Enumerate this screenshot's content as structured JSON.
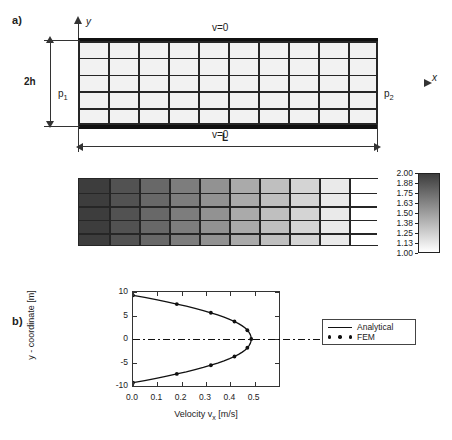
{
  "figure": {
    "panels": [
      {
        "id": "a",
        "label": "a)"
      },
      {
        "id": "b",
        "label": "b)"
      },
      {
        "id": "c",
        "label": "c)"
      }
    ]
  },
  "panel_a": {
    "label": "a)",
    "axis_y_label": "y",
    "axis_x_label": "x",
    "bc_top": "v=0",
    "bc_bottom": "v=0",
    "height_label": "2h",
    "length_label": "L",
    "pressure_inlet": "p",
    "pressure_inlet_sub": "1",
    "pressure_outlet": "p",
    "pressure_outlet_sub": "2",
    "mesh": {
      "columns": 10,
      "rows": 5
    }
  },
  "panel_b": {
    "label": "b)",
    "mesh": {
      "columns": 10,
      "rows": 5
    },
    "colorbar": {
      "max": "2.00",
      "min": "1.00",
      "labels": [
        "2.00",
        "1.88",
        "1.75",
        "1.63",
        "1.50",
        "1.38",
        "1.25",
        "1.13",
        "1.00"
      ],
      "dark_color": "#3d3d3d",
      "light_color": "#ffffff"
    },
    "cell_values": [
      2.0,
      1.89,
      1.78,
      1.67,
      1.56,
      1.44,
      1.33,
      1.22,
      1.11,
      1.0
    ]
  },
  "panel_c": {
    "label": "c)",
    "legend": [
      {
        "name": "analytical",
        "label": "Analytical",
        "style": "line"
      },
      {
        "name": "fem",
        "label": "FEM",
        "style": "dots"
      }
    ]
  },
  "chart_data": {
    "type": "line",
    "title": "",
    "xlabel": "Velocity v",
    "xlabel_sub": "x",
    "xlabel_unit": "[m/s]",
    "ylabel": "y - coordinate [m]",
    "xlim": [
      0.0,
      0.6
    ],
    "ylim": [
      -10,
      10
    ],
    "xticks": [
      0.0,
      0.1,
      0.2,
      0.3,
      0.4,
      0.5
    ],
    "xtick_labels": [
      "0.0",
      "0.1",
      "0.2",
      "0.3",
      "0.4",
      "0.5"
    ],
    "yticks": [
      -10,
      -5,
      0,
      5,
      10
    ],
    "ytick_labels": [
      "-10",
      "-5",
      "0",
      "5",
      "10"
    ],
    "grid": false,
    "legend_position": "right-outside",
    "centerline_y": 0,
    "series": [
      {
        "name": "Analytical",
        "type": "line",
        "x": [
          0.0,
          0.048,
          0.095,
          0.139,
          0.18,
          0.219,
          0.255,
          0.289,
          0.32,
          0.348,
          0.374,
          0.397,
          0.417,
          0.434,
          0.449,
          0.461,
          0.47,
          0.477,
          0.482,
          0.485,
          0.486,
          0.485,
          0.482,
          0.477,
          0.47,
          0.461,
          0.449,
          0.434,
          0.417,
          0.397,
          0.374,
          0.348,
          0.32,
          0.289,
          0.255,
          0.219,
          0.18,
          0.139,
          0.095,
          0.048,
          0.0
        ],
        "y": [
          9.3,
          8.84,
          8.37,
          7.91,
          7.44,
          6.98,
          6.51,
          6.05,
          5.58,
          5.12,
          4.65,
          4.19,
          3.72,
          3.26,
          2.79,
          2.33,
          1.86,
          1.4,
          0.93,
          0.47,
          0.0,
          -0.47,
          -0.93,
          -1.4,
          -1.86,
          -2.33,
          -2.79,
          -3.26,
          -3.72,
          -4.19,
          -4.65,
          -5.12,
          -5.58,
          -6.05,
          -6.51,
          -6.98,
          -7.44,
          -7.91,
          -8.37,
          -8.84,
          -9.3
        ]
      },
      {
        "name": "FEM",
        "type": "scatter",
        "x": [
          0.0,
          0.18,
          0.32,
          0.417,
          0.47,
          0.486,
          0.47,
          0.417,
          0.32,
          0.18,
          0.0
        ],
        "y": [
          9.3,
          7.44,
          5.58,
          3.72,
          1.86,
          0.0,
          -1.86,
          -3.72,
          -5.58,
          -7.44,
          -9.3
        ]
      }
    ]
  }
}
